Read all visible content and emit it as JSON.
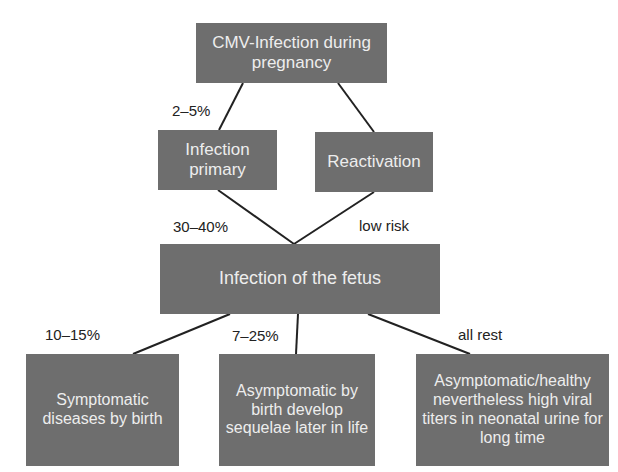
{
  "diagram": {
    "nodes": {
      "root": "CMV-Infection during pregnancy",
      "primary": "Infection primary",
      "reactivation": "Reactivation",
      "fetus": "Infection of the fetus",
      "symptomatic": "Symptomatic diseases by birth",
      "sequelae": "Asymptomatic by birth develop sequelae later in life",
      "healthy": "Asymptomatic/healthy nevertheless high viral titers in neonatal urine for long time"
    },
    "edge_labels": {
      "root_to_primary": "2–5%",
      "primary_to_fetus": "30–40%",
      "reactivation_to_fetus": "low risk",
      "fetus_to_symptomatic": "10–15%",
      "fetus_to_sequelae": "7–25%",
      "fetus_to_healthy": "all rest"
    },
    "colors": {
      "box_fill": "#6e6e6e",
      "box_text": "#ededed",
      "line": "#222222"
    }
  }
}
